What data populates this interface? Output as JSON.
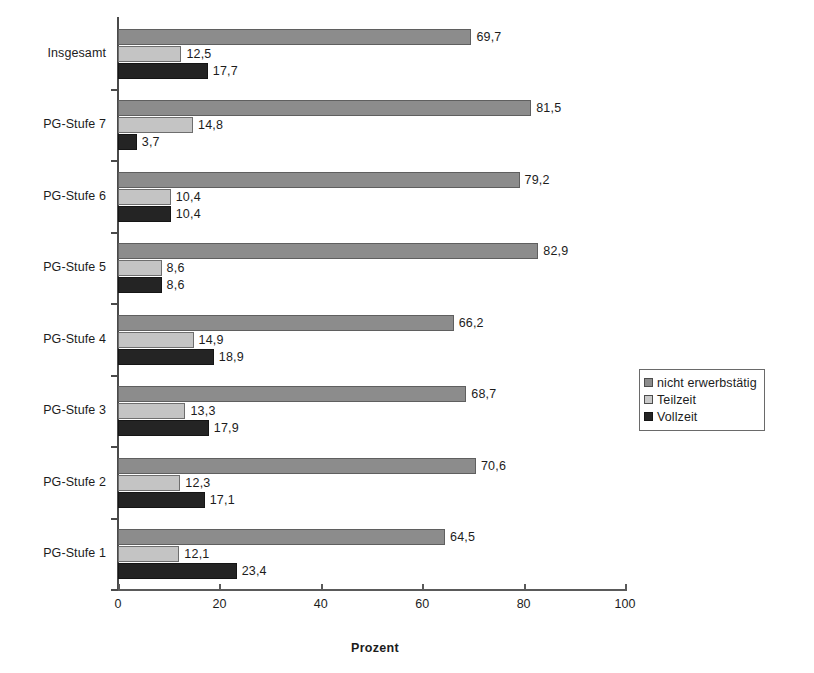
{
  "chart_data": {
    "type": "bar",
    "orientation": "horizontal",
    "title": "",
    "xlabel": "Prozent",
    "ylabel": "",
    "xlim": [
      0,
      100
    ],
    "xticks": [
      0,
      20,
      40,
      60,
      80,
      100
    ],
    "xticklabels": [
      "0",
      "20",
      "40",
      "60",
      "80",
      "100"
    ],
    "grid": false,
    "decimal_separator": ",",
    "legend_position": "right-middle",
    "categories": [
      "Insgesamt",
      "PG-Stufe 7",
      "PG-Stufe 6",
      "PG-Stufe 5",
      "PG-Stufe 4",
      "PG-Stufe 3",
      "PG-Stufe 2",
      "PG-Stufe 1"
    ],
    "series": [
      {
        "name": "nicht erwerbstätig",
        "color": "#8c8c8c",
        "values": [
          69.7,
          81.5,
          79.2,
          82.9,
          66.2,
          68.7,
          70.6,
          64.5
        ],
        "labels": [
          "69,7",
          "81,5",
          "79,2",
          "82,9",
          "66,2",
          "68,7",
          "70,6",
          "64,5"
        ]
      },
      {
        "name": "Teilzeit",
        "color": "#c4c4c4",
        "values": [
          12.5,
          14.8,
          10.4,
          8.6,
          14.9,
          13.3,
          12.3,
          12.1
        ],
        "labels": [
          "12,5",
          "14,8",
          "10,4",
          "8,6",
          "14,9",
          "13,3",
          "12,3",
          "12,1"
        ]
      },
      {
        "name": "Vollzeit",
        "color": "#242424",
        "values": [
          17.7,
          3.7,
          10.4,
          8.6,
          18.9,
          17.9,
          17.1,
          23.4
        ],
        "labels": [
          "17,7",
          "3,7",
          "10,4",
          "8,6",
          "18,9",
          "17,9",
          "17,1",
          "23,4"
        ]
      }
    ]
  },
  "legend": {
    "items": [
      {
        "label": "nicht erwerbstätig"
      },
      {
        "label": "Teilzeit"
      },
      {
        "label": "Vollzeit"
      }
    ]
  }
}
